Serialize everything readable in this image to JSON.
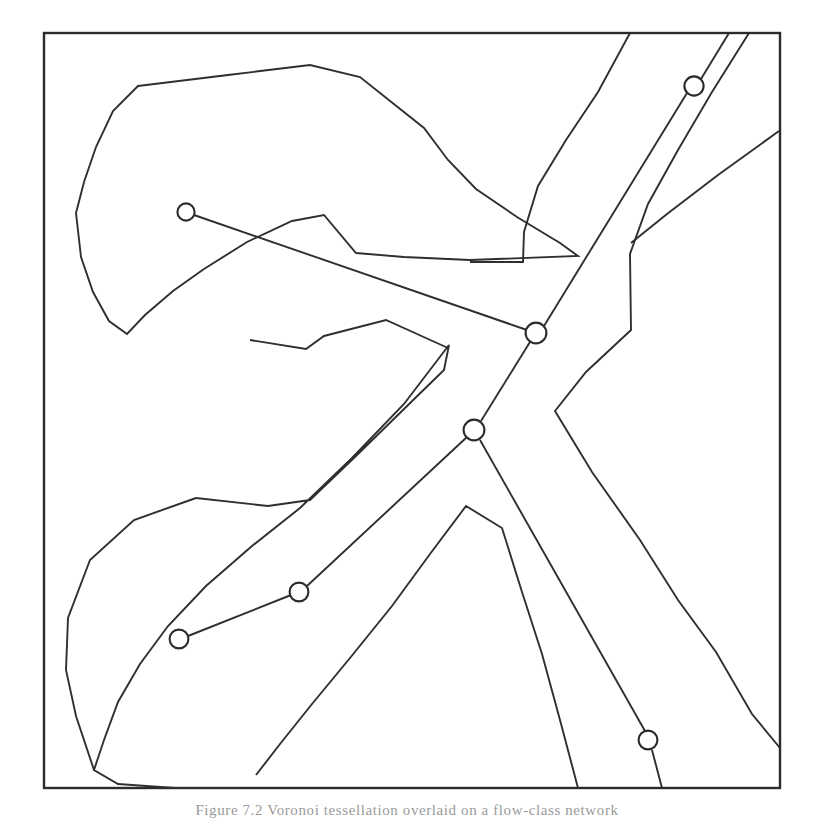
{
  "figure": {
    "kind": "voronoi-network-diagram",
    "caption": "Figure 7.2 Voronoi tessellation overlaid on a flow-class network",
    "frame": {
      "x": 44,
      "y": 33,
      "width": 736,
      "height": 755,
      "stroke": "#2b2b2b",
      "stroke_width": 2.4
    },
    "colors": {
      "background": "#ffffff",
      "stroke": "#2f2f2f",
      "frame_stroke": "#2b2b2b",
      "node_fill": "#ffffff",
      "node_stroke": "#2b2b2b",
      "caption": "#9a9a9a"
    },
    "nodes": [
      {
        "id": "n1",
        "label": "upper-left-site",
        "x": 186,
        "y": 212,
        "r": 8.6
      },
      {
        "id": "n2",
        "label": "central-upper-hub",
        "x": 536,
        "y": 333,
        "r": 10.4
      },
      {
        "id": "n3",
        "label": "central-lower-hub",
        "x": 474,
        "y": 430,
        "r": 10.4
      },
      {
        "id": "n4",
        "label": "upper-right-site",
        "x": 694,
        "y": 86,
        "r": 9.6
      },
      {
        "id": "n5",
        "label": "lower-left-outer-site",
        "x": 179,
        "y": 639,
        "r": 9.4
      },
      {
        "id": "n6",
        "label": "lower-left-inner-site",
        "x": 299,
        "y": 592,
        "r": 9.4
      },
      {
        "id": "n7",
        "label": "lower-right-site",
        "x": 648,
        "y": 740,
        "r": 9.4
      }
    ],
    "edges": [
      {
        "id": "e1",
        "from": "n1",
        "to": "n2"
      },
      {
        "id": "e2",
        "from": "n2",
        "to": "n3"
      },
      {
        "id": "e3",
        "from": "n2",
        "to": "n4"
      },
      {
        "id": "e4",
        "from": "n3",
        "to": "n6"
      },
      {
        "id": "e5",
        "from": "n6",
        "to": "n5"
      },
      {
        "id": "e6",
        "from": "n3",
        "to": "n7"
      }
    ],
    "edge_paths": {
      "e1": "M 194 215 L 528 330",
      "e2": "M 530 341 L 481 422",
      "e3": "M 545 326 L 686 92",
      "e4": "M 467 437 L 306 586",
      "e5": "M 291 595 L 188 636",
      "e6": "M 479 440 L 645 730",
      "e3_tail": "M 701 80 L 779 33",
      "e6_tail": "M 652 750 L 660 788"
    },
    "regions": [
      {
        "id": "r1",
        "label": "upper-left-cell",
        "d": "M 44 33 L 44 33 M 96 81 L 170 85 L 226 70 L 286 66 L 325 76 L 338 130 L 344 180 L 322 219 L 273 243 L 227 256 L 211 300 L 172 328 L 132 343 L 103 334 L 78 310 L 63 268 L 60 216 L 67 161 L 78 112 Z"
      },
      {
        "id": "r2",
        "label": "upper-left-polygon",
        "d": "M 170 82 L 230 63 L 287 50 L 341 52 L 398 57 L 437 75 L 466 109 L 485 152 L 492 197 L 483 240 L 459 264 L 413 273 L 360 270 L 322 259 L 290 253 L 251 265 L 217 281 L 184 299 L 155 321 L 131 340 L 112 331 L 98 300 L 89 264 L 88 222 L 95 181 L 113 141 L 138 108 Z"
      }
    ],
    "region_paths": [
      {
        "id": "poly-upper-left",
        "name": "upper-left-voronoi-cell",
        "d": "M 96 150 L 137 84 L 225 74 L 286 72 L 355 75 L 421 124 L 444 158 L 470 185 L 490 200 L 534 229 L 575 255 L 575 255 L 470 258 L 410 254 L 370 251 L 348 226 L 322 209 L 294 219 L 252 238 L 209 265 L 177 287 L 152 310 L 135 330 L 115 322 L 99 298 L 85 264 L 79 221 L 82 186 Z"
      }
    ],
    "polylines": {
      "cell_upper_left": "M 98 188 L 121 128 L 175 83 L 247 72 L 327 66 L 411 118 L 441 157 L 465 184 L 501 210 L 545 238 L 554 261 L 469 262 L 400 258 L 352 254 L 321 216 L 292 220 L 248 240 L 208 266 L 176 289 L 149 312 L 131 331 L 112 320 L 95 292 L 83 258 L 78 216 L 85 188 Z",
      "cell_lower_left": "M 66 630 L 86 560 L 132 519 L 190 497 L 266 506 L 330 508 L 373 466 L 412 430 L 443 400 L 446 346 L 410 402 L 356 455 L 307 503 L 255 540 L 207 582 L 167 625 L 140 662 L 118 700 L 104 737",
      "cell_right_star": "M 611 33 L 582 96 L 548 146 L 520 196 L 524 260 L 470 262",
      "cell_right_zig": "M 750 33 L 702 106 L 668 166 L 640 222 L 628 270 L 630 330 L 588 372 L 556 411 L 592 470 L 640 538 L 678 598 L 716 650 L 752 712 L 780 746",
      "cell_bottom_mid": "M 578 788 L 558 716 L 540 648 L 520 586 L 502 528 L 466 506 L 430 554 L 392 606 L 350 658 L 312 704 L 280 744 L 250 776"
    },
    "paths": {
      "frame": "M 44 33 L 780 33 L 780 788 L 44 788 Z",
      "upper_left_cell": "M 137 85 L 227 74 L 308 64 L 359 76 L 423 127 L 447 159 L 474 188 L 515 216 L 556 241 L 578 255 L 470 259 L 404 256 L 357 252 L 325 214 L 293 220 L 248 241 L 205 268 L 174 290 L 146 314 L 128 333 L 110 320 L 94 292 L 82 257 L 77 214 L 85 183 L 97 148 L 114 112 Z",
      "lower_left_cell": "M 104 737 L 120 697 L 143 657 L 172 619 L 211 577 L 258 537 L 310 500 L 268 505 L 191 496 L 132 518 L 88 558 L 68 617 L 66 668 L 75 714 L 90 752 L 116 779 L 168 787 L 240 787",
      "right_cell_upper": "M 611 33 L 581 98 L 547 148 L 521 198 L 524 260 L 470 261",
      "right_cell_zig": "M 749 33 L 703 105 L 669 165 L 641 221 L 629 272 L 631 329 L 587 371 L 556 410 L 593 471 L 641 539 L 679 599 L 717 651 L 753 713 L 780 747",
      "bottom_mid_cell": "M 578 788 L 557 715 L 539 647 L 519 585 L 501 527 L 465 505 L 429 553 L 391 605 L 349 657 L 311 703 L 279 743 L 249 775",
      "right_far_edge": "M 779 130 L 719 174 L 668 213 L 630 243"
    }
  },
  "shapes": {
    "frame_outline": "M 44 33 H 780 V 788 H 44 Z",
    "cell_top_left": "M 138 86 L 228 75 L 310 65 L 360 77 L 424 128 L 448 160 L 476 189 L 517 217 L 560 243 L 578 256",
    "cell_top_left_lower": "M 578 256 L 470 260 L 404 257 L 356 253 L 324 215 L 292 221 L 247 242 L 204 269 L 173 291 L 145 315 L 127 334",
    "cell_top_left_left": "M 127 334 L 109 321 L 93 292 L 81 257 L 76 213 L 84 182 L 96 147 L 113 111 L 138 86",
    "notch_shape": "M 250 340 L 305 349 L 322 336 L 385 320 L 444 349 L 400 400 L 352 452 L 305 500 L 257 539 L 216 572 L 176 608 L 140 650 L 112 690 L 96 730 L 90 760",
    "star_zig_upper": "M 611 33 L 580 99 L 546 149 L 520 199 L 523 261 L 470 262",
    "star_zig_right": "M 749 33 L 702 106 L 668 166 L 640 222 L 628 272 L 630 330 L 586 372 L 555 411 L 592 472 L 640 540 L 678 600 L 716 652 L 752 714 L 780 748",
    "right_edge_branch": "M 779 131 L 718 175 L 667 214 L 629 244",
    "bottom_branch": "M 578 788 L 556 714 L 538 646 L 518 584 L 500 526 L 464 504 L 428 552 L 390 604 L 348 656 L 310 702 L 278 742 L 248 774",
    "lower_left_cell_path": "M 310 500 L 267 506 L 190 497 L 131 519 L 87 559 L 67 618 L 65 669 L 74 715 L 89 753 L 115 780 L 167 788",
    "lower_left_inner": "M 167 788 L 240 788"
  }
}
